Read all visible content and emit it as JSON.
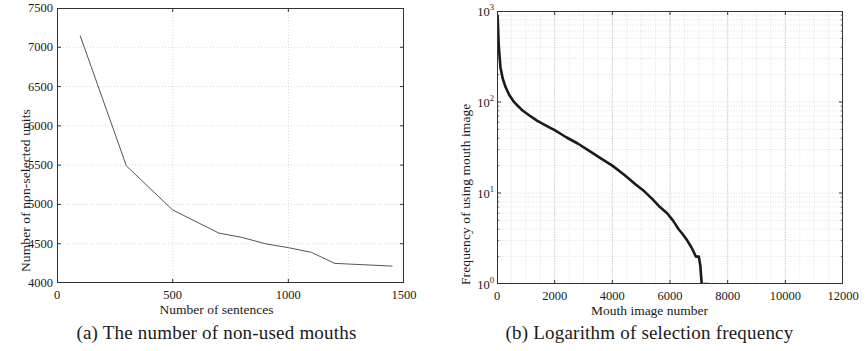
{
  "figure": {
    "panel_a": {
      "caption": "(a) The number of non-used mouths",
      "xlabel": "Number of sentences",
      "ylabel": "Number of non-selected units"
    },
    "panel_b": {
      "caption": "(b) Logarithm of selection frequency",
      "xlabel": "Mouth image number",
      "ylabel": "Frequency of using mouth image"
    }
  },
  "chart_data": [
    {
      "id": "panel-a",
      "type": "line",
      "title": "(a) The number of non-used mouths",
      "xlabel": "Number of sentences",
      "ylabel": "Number of non-selected units",
      "xlim": [
        0,
        1500
      ],
      "ylim": [
        4000,
        7500
      ],
      "xticks": [
        0,
        500,
        1000,
        1500
      ],
      "xticklabels": [
        "0",
        "500",
        "1000",
        "1500"
      ],
      "yticks": [
        4000,
        4500,
        5000,
        5500,
        6000,
        6500,
        7000,
        7500
      ],
      "yticklabels": [
        "4000",
        "4500",
        "5000",
        "5500",
        "6000",
        "6500",
        "7000",
        "7500"
      ],
      "grid": true,
      "legend": null,
      "series": [
        {
          "name": "non-selected units",
          "color": "#555555",
          "x": [
            100,
            300,
            500,
            700,
            800,
            900,
            1000,
            1100,
            1200,
            1450
          ],
          "y": [
            7150,
            5490,
            4930,
            4635,
            4580,
            4500,
            4450,
            4390,
            4250,
            4215
          ]
        }
      ]
    },
    {
      "id": "panel-b",
      "type": "line",
      "title": "(b) Logarithm of selection frequency",
      "xlabel": "Mouth image number",
      "ylabel": "Frequency of using mouth image",
      "xlim": [
        0,
        12000
      ],
      "ylim": [
        1,
        1000
      ],
      "yscale": "log",
      "xticks": [
        0,
        2000,
        4000,
        6000,
        8000,
        10000,
        12000
      ],
      "xticklabels": [
        "0",
        "2000",
        "4000",
        "6000",
        "8000",
        "10000",
        "12000"
      ],
      "yticks": [
        1,
        10,
        100,
        1000
      ],
      "yticklabels": [
        "10^0",
        "10^1",
        "10^2",
        "10^3"
      ],
      "grid": true,
      "legend": null,
      "series": [
        {
          "name": "selection frequency",
          "color": "#1a1a1a",
          "x": [
            20,
            60,
            120,
            200,
            300,
            420,
            560,
            700,
            900,
            1100,
            1400,
            1700,
            2000,
            2400,
            2800,
            3200,
            3600,
            4000,
            4400,
            4800,
            5100,
            5400,
            5650,
            5900,
            6100,
            6300,
            6450,
            6600,
            6750,
            6900,
            7000,
            7050,
            7100
          ],
          "y": [
            900,
            420,
            240,
            180,
            145,
            120,
            103,
            92,
            80,
            72,
            62,
            55,
            49,
            41,
            35,
            29,
            24,
            20,
            16,
            12.5,
            10.5,
            8.5,
            7,
            6,
            5,
            4,
            3.5,
            3,
            2.5,
            2,
            2,
            1.6,
            1
          ]
        }
      ]
    }
  ]
}
